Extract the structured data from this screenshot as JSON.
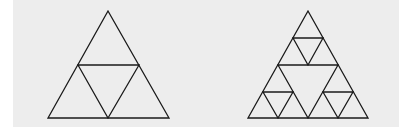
{
  "figure": {
    "background": "#ededed",
    "stroke": "#1a1a1a",
    "panels": [
      {
        "name": "iteration-1",
        "outer": [
          [
            108,
            11
          ],
          [
            48,
            118
          ],
          [
            169,
            118
          ]
        ],
        "inner": [
          [
            [
              78,
              65
            ],
            [
              139,
              65
            ],
            [
              108,
              118
            ]
          ]
        ]
      },
      {
        "name": "iteration-2",
        "outer": [
          [
            308,
            11
          ],
          [
            248,
            118
          ],
          [
            368,
            118
          ]
        ],
        "inner": [
          [
            [
              278,
              65
            ],
            [
              338,
              65
            ],
            [
              308,
              118
            ]
          ],
          [
            [
              293,
              38
            ],
            [
              323,
              38
            ],
            [
              308,
              65
            ]
          ],
          [
            [
              263,
              92
            ],
            [
              293,
              92
            ],
            [
              278,
              118
            ]
          ],
          [
            [
              323,
              92
            ],
            [
              353,
              92
            ],
            [
              338,
              118
            ]
          ]
        ]
      }
    ]
  }
}
